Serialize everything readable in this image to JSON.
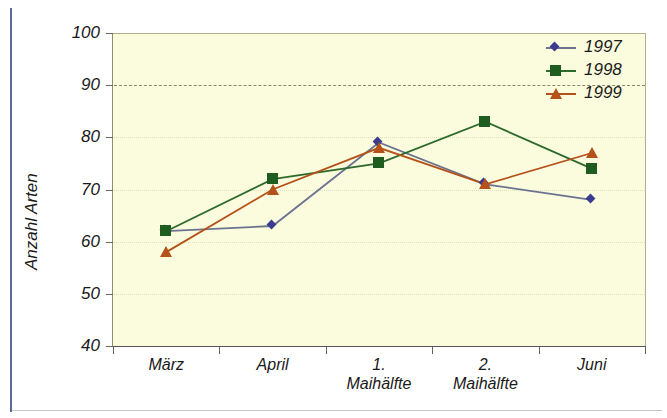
{
  "chart_data": {
    "type": "line",
    "title": "",
    "xlabel": "",
    "ylabel": "Anzahl Arten",
    "ylim": [
      40,
      100
    ],
    "ytick_labels": [
      "100",
      "90",
      "80",
      "70",
      "60",
      "50",
      "40"
    ],
    "yticks": [
      100,
      90,
      80,
      70,
      60,
      50,
      40
    ],
    "grid": true,
    "grid_emphasis_value": 90,
    "legend_position": "top-right",
    "categories": [
      "März",
      "April",
      "1. Maihälfte",
      "2. Maihälfte",
      "Juni"
    ],
    "category_lines": [
      [
        "März",
        ""
      ],
      [
        "April",
        ""
      ],
      [
        "1.",
        "Maihälfte"
      ],
      [
        "2.",
        "Maihälfte"
      ],
      [
        "Juni",
        ""
      ]
    ],
    "series": [
      {
        "name": "1997",
        "marker": "diamond",
        "color": "#3b3b8f",
        "line_color": "#6b7390",
        "values": [
          62,
          63,
          79,
          71,
          68
        ]
      },
      {
        "name": "1998",
        "marker": "square",
        "color": "#1f5c1f",
        "line_color": "#2d6a2d",
        "values": [
          62,
          72,
          75,
          83,
          74
        ]
      },
      {
        "name": "1999",
        "marker": "triangle",
        "color": "#b4521a",
        "line_color": "#b4521a",
        "values": [
          58,
          70,
          78,
          71,
          77
        ]
      }
    ]
  },
  "figure": {
    "plot_background": "#fbfbdd",
    "frame_accent_color": "#5a6a92"
  }
}
